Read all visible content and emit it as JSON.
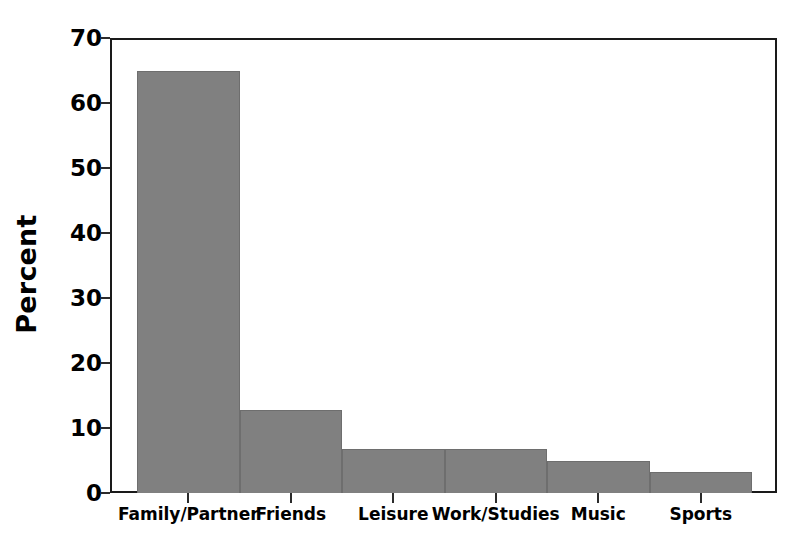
{
  "chart_data": {
    "type": "bar",
    "title": "",
    "subtitle": "",
    "xlabel": "",
    "ylabel": "Percent",
    "categories": [
      "Family/Partner",
      "Friends",
      "Leisure",
      "Work/Studies",
      "Music",
      "Sports"
    ],
    "values": [
      65.0,
      12.8,
      6.7,
      6.7,
      5.0,
      3.2
    ],
    "ylim": [
      0,
      70
    ],
    "yticks": [
      0,
      10,
      20,
      30,
      40,
      50,
      60,
      70
    ],
    "ytick_labels": [
      "0",
      "10",
      "20",
      "30",
      "40",
      "50",
      "60",
      "70"
    ],
    "grid": false,
    "legend": null,
    "legend_position": "none",
    "bar_style": "adjacent",
    "colors": {
      "bar_fill": "#808080",
      "bar_edge": "#6e6e6e",
      "axis": "#1a1a1a",
      "text": "#000000",
      "background": "#ffffff"
    }
  }
}
